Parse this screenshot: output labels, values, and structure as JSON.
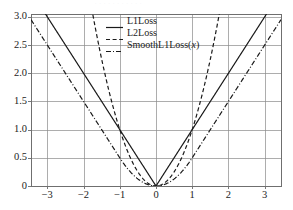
{
  "figure": {
    "title_faint": ". . . . . .    . . . . .",
    "background": "#ffffff",
    "axis_color": "#777777",
    "grid_color": "#8a8a8a",
    "curve_color": "#1a1a1a"
  },
  "legend": {
    "position": "top-center",
    "entries": [
      {
        "label": "L1Loss",
        "style": "solid",
        "name": "legend-item-l1loss"
      },
      {
        "label": "L2Loss",
        "style": "dashed",
        "name": "legend-item-l2loss"
      },
      {
        "label": "SmoothL1Loss(",
        "label_italic": "x",
        "label_tail": ")",
        "style": "dashdot",
        "name": "legend-item-smoothl1loss"
      }
    ]
  },
  "axes": {
    "y_ticks": [
      "3.0",
      "2.5",
      "2.0",
      "1.5",
      "1.0",
      "0.5",
      "0"
    ],
    "y_tick_values": [
      3.0,
      2.5,
      2.0,
      1.5,
      1.0,
      0.5,
      0.0
    ],
    "x_ticks": [
      "−3",
      "−2",
      "−1",
      "0",
      "1",
      "2",
      "3"
    ],
    "x_tick_values": [
      -3,
      -2,
      -1,
      0,
      1,
      2,
      3
    ],
    "xlabel": "",
    "ylabel": ""
  },
  "chart_data": {
    "type": "line",
    "title": "",
    "xlabel": "",
    "ylabel": "",
    "xlim": [
      -3.45,
      3.45
    ],
    "ylim": [
      0.0,
      3.05
    ],
    "grid": true,
    "legend_position": "top-center",
    "x": [
      -3.45,
      -3.0,
      -2.5,
      -2.0,
      -1.5,
      -1.0,
      -0.75,
      -0.5,
      -0.25,
      0.0,
      0.25,
      0.5,
      0.75,
      1.0,
      1.5,
      2.0,
      2.5,
      3.0,
      3.45
    ],
    "series": [
      {
        "name": "L1Loss",
        "style": "solid",
        "formula": "|x|",
        "values": [
          3.45,
          3.0,
          2.5,
          2.0,
          1.5,
          1.0,
          0.75,
          0.5,
          0.25,
          0.0,
          0.25,
          0.5,
          0.75,
          1.0,
          1.5,
          2.0,
          2.5,
          3.0,
          3.45
        ]
      },
      {
        "name": "L2Loss",
        "style": "dashed",
        "formula": "x^2",
        "values": [
          11.9,
          9.0,
          6.25,
          4.0,
          2.25,
          1.0,
          0.5625,
          0.25,
          0.0625,
          0.0,
          0.0625,
          0.25,
          0.5625,
          1.0,
          2.25,
          4.0,
          6.25,
          9.0,
          11.9
        ]
      },
      {
        "name": "SmoothL1Loss(x)",
        "style": "dashdot",
        "formula": "0.5x^2 if |x|<1 else |x|-0.5",
        "values": [
          2.95,
          2.5,
          2.0,
          1.5,
          1.0,
          0.5,
          0.28125,
          0.125,
          0.03125,
          0.0,
          0.03125,
          0.125,
          0.28125,
          0.5,
          1.0,
          1.5,
          2.0,
          2.5,
          2.95
        ]
      }
    ]
  }
}
